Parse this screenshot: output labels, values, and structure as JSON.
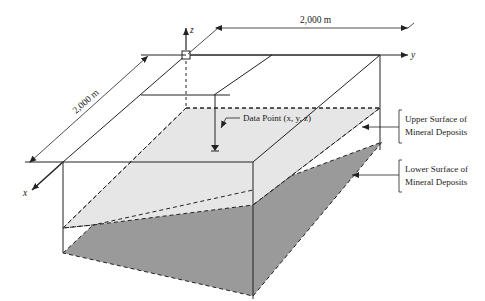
{
  "diagram": {
    "dimensions": {
      "width_label": "2,000 m",
      "depth_label": "2,000 m"
    },
    "axes": {
      "x": "x",
      "y": "y",
      "z": "z"
    },
    "annotations": {
      "data_point": "Data Point (x, y, z)",
      "upper_surface_line1": "Upper Surface of",
      "upper_surface_line2": "Mineral Deposits",
      "lower_surface_line1": "Lower Surface of",
      "lower_surface_line2": "Mineral Deposits"
    },
    "colors": {
      "upper_surface_fill": "#e4e4e4",
      "lower_surface_fill": "#9a9a9a",
      "line": "#222222"
    }
  }
}
